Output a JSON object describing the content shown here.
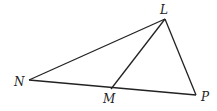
{
  "diagram": {
    "type": "triangle",
    "points": {
      "L": {
        "label": "L",
        "x": 165,
        "y": 19,
        "lx": 160,
        "ly": 14
      },
      "N": {
        "label": "N",
        "x": 29,
        "y": 80,
        "lx": 14,
        "ly": 86
      },
      "M": {
        "label": "M",
        "x": 111,
        "y": 89,
        "lx": 103,
        "ly": 103
      },
      "P": {
        "label": "P",
        "x": 196,
        "y": 95,
        "lx": 201,
        "ly": 101
      }
    },
    "segments": [
      [
        "N",
        "L"
      ],
      [
        "L",
        "P"
      ],
      [
        "N",
        "P"
      ],
      [
        "L",
        "M"
      ]
    ],
    "colors": {
      "stroke": "#222222",
      "background": "#ffffff"
    }
  }
}
